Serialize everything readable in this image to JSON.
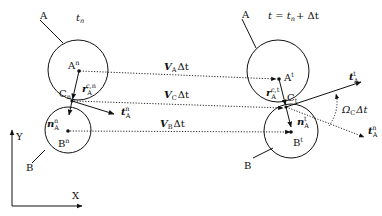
{
  "diagram": {
    "left_state": {
      "time_label": "t",
      "time_sub": "n",
      "body_a_label": "A",
      "body_b_label": "B",
      "center_a": "A",
      "center_a_sup": "n",
      "center_b": "B",
      "center_b_sup": "n",
      "contact": "C",
      "contact_sub": "n",
      "r_vec": "r",
      "r_sub": "A",
      "r_sup": "c,n",
      "n_vec": "n",
      "n_sub": "A",
      "n_sup": "n",
      "t_vec": "t",
      "t_sub": "A",
      "t_sup": "n"
    },
    "right_state": {
      "time_label": "t = t",
      "time_sub": "n",
      "time_rest": "+ Δt",
      "body_a_label": "A",
      "body_b_label": "B",
      "center_a": "A",
      "center_a_sup": "t",
      "center_b": "B",
      "center_b_sup": "t",
      "contact": "C",
      "contact_sub": "t",
      "r_vec": "r",
      "r_sub": "A",
      "r_sup": "c,t",
      "n_vec": "n",
      "n_sub": "A",
      "n_sup": "t",
      "t_vec_new": "t",
      "t_vec_new_sub": "A",
      "t_vec_new_sup": "t",
      "t_vec_old": "t",
      "t_vec_old_sub": "A",
      "t_vec_old_sup": "n",
      "rotation_label": "Ω",
      "rotation_sub": "C",
      "rotation_rest": "Δt"
    },
    "displacements": {
      "va": "V",
      "va_sub": "A",
      "va_rest": "Δt",
      "vc": "V",
      "vc_sub": "C",
      "vc_rest": "Δt",
      "vb": "V",
      "vb_sub": "B",
      "vb_rest": "Δt"
    },
    "axes": {
      "x_label": "X",
      "y_label": "Y"
    },
    "colors": {
      "ink": "#111111",
      "background": "#ffffff"
    }
  }
}
